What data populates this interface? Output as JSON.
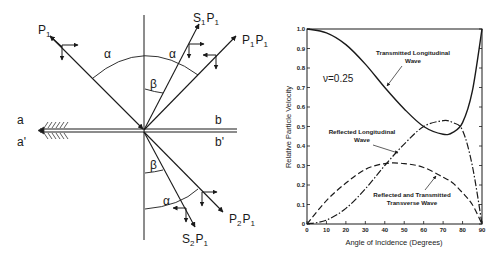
{
  "diagram": {
    "incident_label": "P",
    "incident_sub": "1",
    "reflected_s_label": "S",
    "reflected_s_sub": "1",
    "reflected_s_label2": "P",
    "reflected_s_sub2": "1",
    "reflected_p_label": "P",
    "reflected_p_sub": "1",
    "reflected_p_label2": "P",
    "reflected_p_sub2": "1",
    "transmitted_p_label": "P",
    "transmitted_p_sub": "2",
    "transmitted_p_label2": "P",
    "transmitted_p_sub2": "1",
    "transmitted_s_label": "S",
    "transmitted_s_sub": "2",
    "transmitted_s_label2": "P",
    "transmitted_s_sub2": "1",
    "alpha": "α",
    "beta": "β",
    "interface_left_top": "a",
    "interface_left_bottom": "a'",
    "interface_right_top": "b",
    "interface_right_bottom": "b'"
  },
  "chart_data": {
    "type": "line",
    "title": "",
    "xlabel": "Angle of Incidence (Degrees)",
    "ylabel": "Relative Particle Velocity",
    "xlim": [
      0,
      90
    ],
    "ylim": [
      0,
      1.0
    ],
    "xticks": [
      "0",
      "10",
      "20",
      "30",
      "40",
      "50",
      "60",
      "70",
      "80",
      "90"
    ],
    "yticks": [
      "0",
      "0.1",
      "0.2",
      "0.3",
      "0.4",
      "0.5",
      "0.6",
      "0.7",
      "0.8",
      "0.9",
      "1.0"
    ],
    "grid": false,
    "annotation_param": "ν=0.25",
    "x": [
      0,
      10,
      20,
      30,
      40,
      50,
      60,
      70,
      75,
      80,
      85,
      90
    ],
    "series": [
      {
        "name": "Transmitted Longitudinal Wave",
        "style": "solid",
        "values": [
          1.0,
          0.98,
          0.92,
          0.82,
          0.7,
          0.59,
          0.5,
          0.46,
          0.47,
          0.52,
          0.68,
          1.0
        ]
      },
      {
        "name": "Reflected Longitudinal Wave",
        "style": "dash-dot",
        "values": [
          0.0,
          0.02,
          0.08,
          0.18,
          0.3,
          0.41,
          0.5,
          0.53,
          0.52,
          0.48,
          0.3,
          0.0
        ]
      },
      {
        "name": "Reflected and Transmitted Transverse Wave",
        "style": "dashed",
        "values": [
          0.0,
          0.12,
          0.21,
          0.28,
          0.31,
          0.31,
          0.29,
          0.24,
          0.21,
          0.16,
          0.1,
          0.0
        ]
      }
    ],
    "labels": {
      "transmitted_line1": "Transmitted Longitudinal",
      "transmitted_line2": "Wave",
      "reflected_line1": "Reflected Longitudinal",
      "reflected_line2": "Wave",
      "transverse_line1": "Reflected and Transmitted",
      "transverse_line2": "Transverse Wave"
    }
  }
}
